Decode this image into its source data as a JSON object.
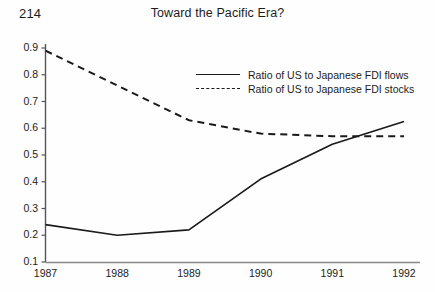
{
  "page": {
    "number": "214",
    "title": "Toward the Pacific Era?"
  },
  "chart_data": {
    "type": "line",
    "title": "Toward the Pacific Era?",
    "xlabel": "",
    "ylabel": "",
    "x": [
      "1987",
      "1988",
      "1989",
      "1990",
      "1991",
      "1992"
    ],
    "categories": [
      "1987",
      "1988",
      "1989",
      "1990",
      "1991",
      "1992"
    ],
    "series": [
      {
        "name": "Ratio of US to Japanese FDI flows",
        "style": "solid",
        "color": "#1a1a1a",
        "values": [
          0.24,
          0.2,
          0.22,
          0.41,
          0.54,
          0.625
        ]
      },
      {
        "name": "Ratio of US to Japanese FDI stocks",
        "style": "dashed",
        "color": "#1a1a1a",
        "values": [
          0.89,
          0.76,
          0.63,
          0.58,
          0.57,
          0.57
        ]
      }
    ],
    "yticks": [
      0.1,
      0.2,
      0.3,
      0.4,
      0.5,
      0.6,
      0.7,
      0.8,
      0.9
    ],
    "ytick_labels": [
      "0.1",
      "0.2",
      "0.3",
      "0.4",
      "0.5",
      "0.6",
      "0.7",
      "0.8",
      "0.9"
    ],
    "xtick_labels": [
      "1987",
      "1988",
      "1989",
      "1990",
      "1991",
      "1992"
    ],
    "ylim": [
      0.1,
      0.9
    ],
    "xlim": [
      "1987",
      "1992"
    ],
    "grid": false,
    "legend_position": "upper center",
    "legend": [
      "Ratio of US to Japanese FDI flows",
      "Ratio of US to Japanese FDI stocks"
    ]
  },
  "axes": {
    "y_labels": [
      "0.9",
      "0.8",
      "0.7",
      "0.6",
      "0.5",
      "0.4",
      "0.3",
      "0.2",
      "0.1"
    ],
    "x_labels": [
      "1987",
      "1988",
      "1989",
      "1990",
      "1991",
      "1992"
    ]
  }
}
